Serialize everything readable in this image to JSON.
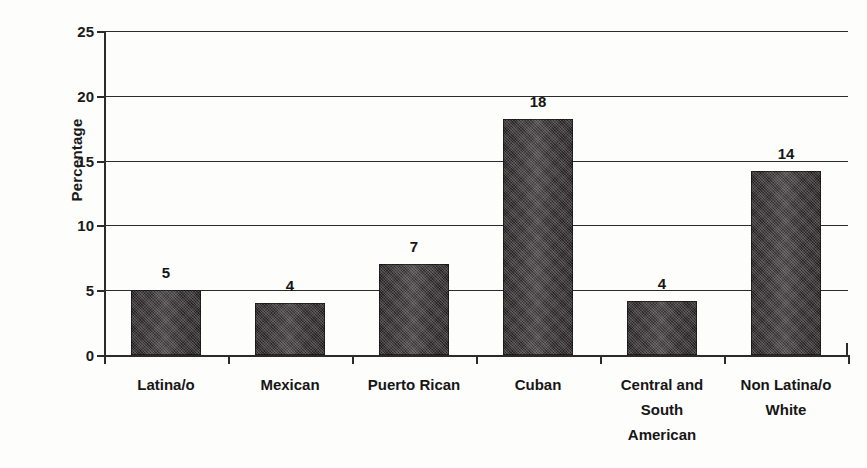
{
  "chart_data": {
    "type": "bar",
    "title": "",
    "subtitle": "",
    "xlabel": "",
    "ylabel": "Percentage",
    "categories": [
      "Latina/o",
      "Mexican",
      "Puerto Rican",
      "Cuban",
      "Central and South American",
      "Non Latina/o White"
    ],
    "category_lines": [
      [
        "Latina/o"
      ],
      [
        "Mexican"
      ],
      [
        "Puerto Rican"
      ],
      [
        "Cuban"
      ],
      [
        "Central and",
        "South",
        "American"
      ],
      [
        "Non Latina/o",
        "White"
      ]
    ],
    "values": [
      5,
      4,
      7,
      18,
      4,
      14
    ],
    "bar_tops": [
      5.0,
      4.0,
      7.0,
      18.2,
      4.2,
      14.2
    ],
    "data_labels": [
      "5",
      "4",
      "7",
      "18",
      "4",
      "14"
    ],
    "ylim": [
      0,
      25
    ],
    "ytick_labels": [
      "0",
      "5",
      "10",
      "15",
      "20",
      "25"
    ],
    "ytick_values": [
      0,
      5,
      10,
      15,
      20,
      25
    ],
    "grid": true,
    "legend": "none",
    "bar_color": "#241f21",
    "axis_color": "#2b2b2b",
    "background_color": "#fdfdfc"
  }
}
